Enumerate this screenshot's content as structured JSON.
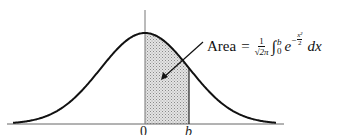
{
  "chart_data": {
    "type": "area",
    "title": "",
    "curve": "standard normal pdf",
    "shaded_interval": [
      "0",
      "b"
    ],
    "x_tick_labels": [
      "0",
      "b"
    ],
    "annotation": {
      "label": "Area",
      "equals": "=",
      "fraction_numerator": "1",
      "fraction_denominator": "√2π",
      "integral_symbol": "∫",
      "lower_limit": "0",
      "upper_limit": "b",
      "base": "e",
      "exponent_sign": "−",
      "exponent_numerator": "x²",
      "exponent_denominator": "2",
      "differential": "dx"
    },
    "colors": {
      "curve": "#111111",
      "shade": "#cfcfcf",
      "axis": "#555555"
    }
  }
}
